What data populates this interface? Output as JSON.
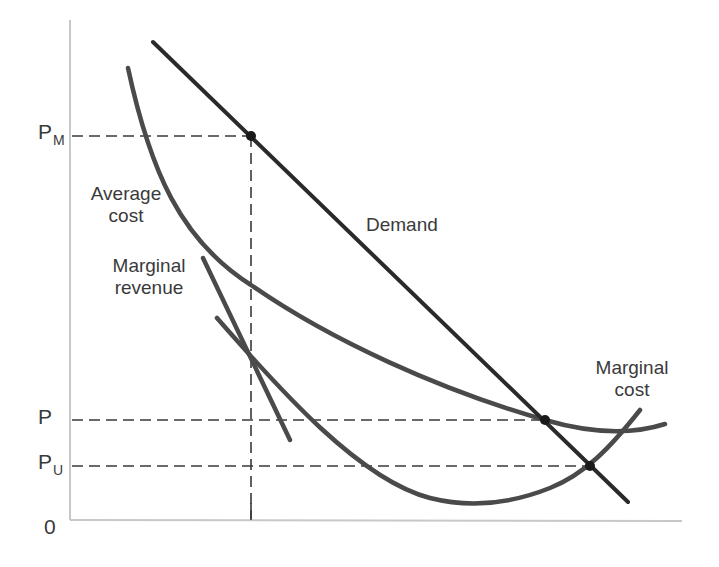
{
  "diagram": {
    "type": "economics-natural-monopoly-regulation",
    "colors": {
      "curve": "#4a4a4a",
      "demand": "#2a2a2a",
      "axis": "#c8c8c8",
      "dashed": "#3a3a3a",
      "text": "#3a3a3a"
    },
    "axis": {
      "origin_label": "0"
    },
    "price_levels": [
      {
        "id": "pm",
        "main": "P",
        "sub": "M"
      },
      {
        "id": "p",
        "main": "P",
        "sub": ""
      },
      {
        "id": "pu",
        "main": "P",
        "sub": "U"
      }
    ],
    "curves": {
      "demand": {
        "label": "Demand"
      },
      "average_cost": {
        "label_line1": "Average",
        "label_line2": "cost"
      },
      "marginal_revenue": {
        "label_line1": "Marginal",
        "label_line2": "revenue"
      },
      "marginal_cost": {
        "label_line1": "Marginal",
        "label_line2": "cost"
      }
    }
  }
}
